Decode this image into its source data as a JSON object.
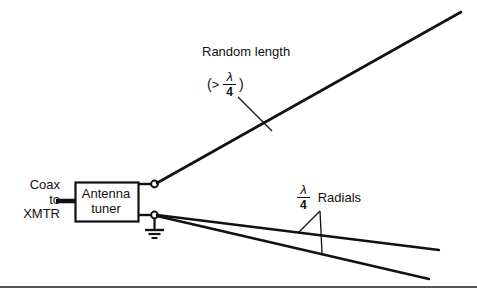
{
  "diagram": {
    "stroke_color": "#111111",
    "background_color": "#ffffff"
  },
  "feed": {
    "line1": "Coax",
    "line2": "to",
    "line3": "XMTR"
  },
  "tuner": {
    "line1": "Antenna",
    "line2": "tuner"
  },
  "radiator": {
    "label": "Random length",
    "condition_open_paren": "(",
    "condition_operator": ">",
    "condition_numerator": "λ",
    "condition_denominator": "4",
    "condition_close_paren": ")"
  },
  "radials": {
    "numerator": "λ",
    "denominator": "4",
    "label": "Radials"
  },
  "symbols": {
    "ground": "earth-ground",
    "terminal_upper": "antenna-terminal",
    "terminal_lower": "ground-terminal"
  }
}
